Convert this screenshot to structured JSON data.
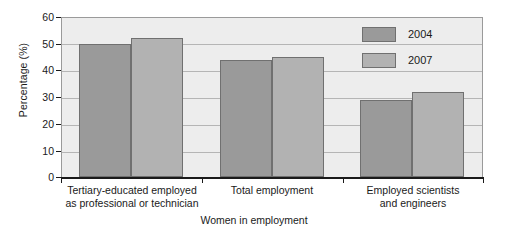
{
  "chart_data": {
    "type": "bar",
    "title": "",
    "subtitle": "",
    "xlabel": "Women in employment",
    "ylabel": "Percentage (%)",
    "ylim": [
      0,
      60
    ],
    "ytick_labels": [
      "0",
      "10",
      "20",
      "30",
      "40",
      "50",
      "60"
    ],
    "ytick_values": [
      0,
      10,
      20,
      30,
      40,
      50,
      60
    ],
    "grid": true,
    "legend_position": "top-right-inside",
    "categories": [
      "Tertiary-educated employed\nas professional or technician",
      "Total employment",
      "Employed scientists\nand engineers"
    ],
    "series": [
      {
        "name": "2004",
        "color": "#9a9a9a",
        "values": [
          49.7,
          44,
          29
        ]
      },
      {
        "name": "2007",
        "color": "#b2b2b2",
        "values": [
          52,
          45,
          32
        ]
      }
    ]
  },
  "legend": {
    "items": [
      {
        "label": "2004",
        "color": "#9a9a9a"
      },
      {
        "label": "2007",
        "color": "#b2b2b2"
      }
    ]
  },
  "axes": {
    "y_title": "Percentage (%)",
    "x_title": "Women in employment",
    "y_ticks": [
      "60",
      "50",
      "40",
      "30",
      "20",
      "10",
      "0"
    ],
    "x_group_labels": [
      "Tertiary-educated employed\nas professional or technician",
      "Total employment",
      "Employed scientists\nand engineers"
    ]
  }
}
